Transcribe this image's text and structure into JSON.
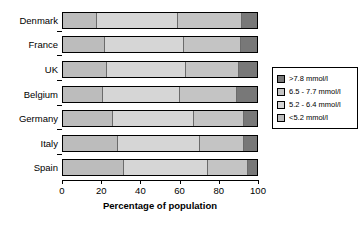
{
  "chart_data": {
    "type": "bar",
    "orientation": "horizontal",
    "stacked": true,
    "title": "",
    "xlabel": "Percentage of population",
    "ylabel": "",
    "xlim": [
      0,
      100
    ],
    "xticks": [
      0,
      20,
      40,
      60,
      80,
      100
    ],
    "xtick_labels": [
      "0",
      "20",
      "40",
      "60",
      "80",
      "100"
    ],
    "grid": false,
    "legend_position": "right",
    "categories": [
      "Denmark",
      "France",
      "UK",
      "Belgium",
      "Germany",
      "Italy",
      "Spain"
    ],
    "series": [
      {
        "name": "<5.2 mmol/l",
        "color": "#bcbcbc",
        "values": [
          17,
          21,
          22,
          20,
          25,
          28,
          31
        ]
      },
      {
        "name": "5.2 - 6.4 mmol/l",
        "color": "#d6d6d6",
        "values": [
          42,
          41,
          41,
          40,
          42,
          42,
          43
        ]
      },
      {
        "name": "6.5 - 7.7 mmol/l",
        "color": "#c4c4c4",
        "values": [
          33,
          29,
          27,
          29,
          26,
          23,
          21
        ]
      },
      {
        "name": ">7.8 mmol/l",
        "color": "#787878",
        "values": [
          8,
          9,
          10,
          11,
          7,
          7,
          5
        ]
      }
    ]
  },
  "legend": {
    "items": [
      {
        "label": ">7.8 mmol/l",
        "color": "#787878"
      },
      {
        "label": "6.5 - 7.7 mmol/l",
        "color": "#c4c4c4"
      },
      {
        "label": "5.2 - 6.4 mmol/l",
        "color": "#d6d6d6"
      },
      {
        "label": "<5.2 mmol/l",
        "color": "#bcbcbc"
      }
    ]
  },
  "axis": {
    "xlabel": "Percentage of population"
  }
}
